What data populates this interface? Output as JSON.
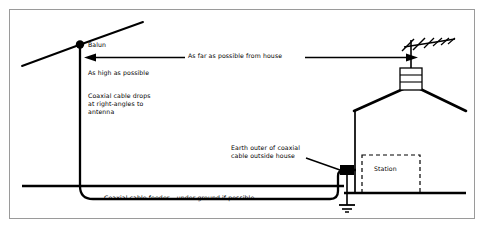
{
  "figure": {
    "background_color": "#ffffff",
    "line_color": "#000000",
    "border_color": "#9a9a9a"
  },
  "labels": {
    "balun": "Balun",
    "as_far_as_possible": "As far as possible from house",
    "as_high_as_possible": "As high as possible",
    "coax_drops": "Coaxial cable drops\nat right-angles to\nantenna",
    "earth_outer": "Earth outer of coaxial\ncable outside house",
    "station": "Station",
    "feeder": "Coaxial cable feeder – under ground if possible"
  },
  "elements": {
    "dipole_icon": "dipole-antenna",
    "balun_icon": "balun-dot",
    "mast_icon": "vertical-mast",
    "arrow_icon": "double-headed-arrow",
    "house_icon": "house-gable-roof",
    "yagi_icon": "yagi-tv-antenna",
    "chimney_icon": "chimney-stack",
    "ground_icon": "earth-ground-symbol",
    "connector_icon": "coax-connector-block",
    "station_box_icon": "dashed-room-outline",
    "ground_line_icon": "ground-surface-line",
    "leader_icon": "callout-leader-line"
  }
}
